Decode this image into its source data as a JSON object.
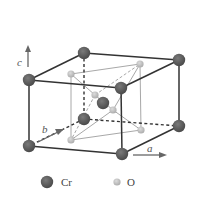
{
  "diagram": {
    "type": "crystal-unit-cell",
    "axes": {
      "a": "a",
      "b": "b",
      "c": "c"
    },
    "legend": [
      {
        "symbol": "Cr",
        "color": "#5a5a5a",
        "size": "large"
      },
      {
        "symbol": "O",
        "color": "#bdbdbd",
        "size": "small"
      }
    ],
    "atoms": {
      "Cr": [
        {
          "pos": "corner-back-top-left"
        },
        {
          "pos": "corner-back-top-right"
        },
        {
          "pos": "corner-front-top-left"
        },
        {
          "pos": "corner-front-top-right"
        },
        {
          "pos": "corner-back-bottom-left"
        },
        {
          "pos": "corner-back-bottom-right"
        },
        {
          "pos": "corner-front-bottom-left"
        },
        {
          "pos": "corner-front-bottom-right"
        },
        {
          "pos": "body-center"
        }
      ],
      "O": [
        {
          "pos": "upper-left"
        },
        {
          "pos": "upper-right"
        },
        {
          "pos": "inner-upper"
        },
        {
          "pos": "inner-lower"
        },
        {
          "pos": "lower-left"
        },
        {
          "pos": "lower-right"
        }
      ]
    },
    "colors": {
      "cr_fill": "#5a5a5a",
      "o_fill": "#bdbdbd",
      "cell_edge": "#333333",
      "octahedron_edge": "#a8a8a8",
      "arrow": "#666666"
    }
  }
}
